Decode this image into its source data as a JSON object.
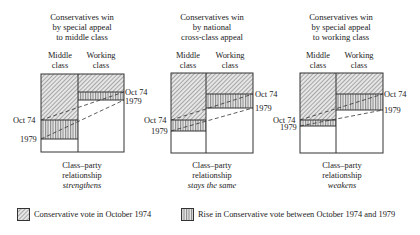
{
  "panels": [
    {
      "title": [
        "Conservatives win",
        "by special appeal",
        "to middle class"
      ],
      "columns": [
        "Middle",
        "class",
        "Working",
        "class"
      ],
      "caption": [
        "Class–party",
        "relationship",
        "strengthens"
      ],
      "labels": {
        "mid_oct74": "Oct 74",
        "mid_1979": "1979",
        "work_oct74": "Oct 74",
        "work_1979": "1979"
      }
    },
    {
      "title": [
        "Conservatives win",
        "by national",
        "cross-class appeal"
      ],
      "columns": [
        "Middle",
        "class",
        "Working",
        "class"
      ],
      "caption": [
        "Class–party",
        "relationship",
        "stays the same"
      ],
      "labels": {
        "mid_oct74": "Oct 74",
        "mid_1979": "1979",
        "work_oct74": "Oct 74",
        "work_1979": "1979"
      }
    },
    {
      "title": [
        "Conservatives win",
        "by special appeal",
        "to working class"
      ],
      "columns": [
        "Middle",
        "class",
        "Working",
        "class"
      ],
      "caption": [
        "Class–party",
        "relationship",
        "weakens"
      ],
      "labels": {
        "mid_oct74": "Oct 74",
        "mid_1979": "1979",
        "work_oct74": "Oct 74",
        "work_1979": "1979"
      }
    }
  ],
  "legend": {
    "oct74": "Conservative vote in October 1974",
    "rise": "Rise in Conservative vote between October 1974 and 1979"
  },
  "colors": {
    "line": "#333333",
    "hatch": "#555555",
    "bg": "#ffffff"
  }
}
